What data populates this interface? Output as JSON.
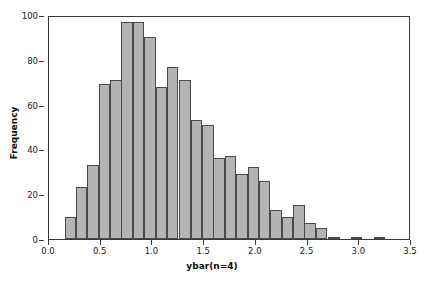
{
  "chart_data": {
    "type": "bar",
    "title": "",
    "subtitle": "",
    "xlabel": "ybar(n=4)",
    "ylabel": "Frequency",
    "xlim": [
      0.0,
      3.5
    ],
    "ylim": [
      0,
      100
    ],
    "grid": false,
    "legend": null,
    "bin_width": 0.1111,
    "bin_starts": [
      0.15,
      0.26,
      0.37,
      0.48,
      0.59,
      0.7,
      0.81,
      0.92,
      1.03,
      1.14,
      1.26,
      1.37,
      1.48,
      1.59,
      1.7,
      1.81,
      1.92,
      2.03,
      2.14,
      2.25,
      2.36,
      2.47,
      2.58,
      2.7,
      2.92,
      3.14
    ],
    "categories": [
      "0.15",
      "0.26",
      "0.37",
      "0.48",
      "0.59",
      "0.70",
      "0.81",
      "0.92",
      "1.03",
      "1.14",
      "1.26",
      "1.37",
      "1.48",
      "1.59",
      "1.70",
      "1.81",
      "1.92",
      "2.03",
      "2.14",
      "2.25",
      "2.36",
      "2.47",
      "2.58",
      "2.70",
      "2.92",
      "3.14"
    ],
    "values": [
      10,
      23,
      33,
      69,
      71,
      97,
      97,
      90,
      68,
      77,
      71,
      53,
      51,
      36,
      37,
      29,
      32,
      26,
      13,
      10,
      15,
      7,
      5,
      1,
      1,
      1
    ],
    "bar_color": "#b4b4b4",
    "bar_edge_color": "#4a4a4a",
    "axis_color": "#3a3a3a",
    "xticks": [
      {
        "value": 0.0,
        "label": "0.0"
      },
      {
        "value": 0.5,
        "label": "0.5"
      },
      {
        "value": 1.0,
        "label": "1.0"
      },
      {
        "value": 1.5,
        "label": "1.5"
      },
      {
        "value": 2.0,
        "label": "2.0"
      },
      {
        "value": 2.5,
        "label": "2.5"
      },
      {
        "value": 3.0,
        "label": "3.0"
      },
      {
        "value": 3.5,
        "label": "3.5"
      }
    ],
    "yticks": [
      {
        "value": 0,
        "label": "0"
      },
      {
        "value": 20,
        "label": "20"
      },
      {
        "value": 40,
        "label": "40"
      },
      {
        "value": 60,
        "label": "60"
      },
      {
        "value": 80,
        "label": "80"
      },
      {
        "value": 100,
        "label": "100"
      }
    ]
  }
}
